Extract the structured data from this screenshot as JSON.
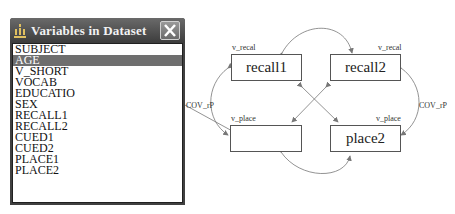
{
  "dialog": {
    "title": "Variables in Dataset",
    "icon": "variables-icon",
    "close_icon": "close-icon",
    "items": [
      {
        "label": "SUBJECT",
        "selected": false
      },
      {
        "label": "AGE",
        "selected": true
      },
      {
        "label": "V_SHORT",
        "selected": false
      },
      {
        "label": "VOCAB",
        "selected": false
      },
      {
        "label": "EDUCATIO",
        "selected": false
      },
      {
        "label": "SEX",
        "selected": false
      },
      {
        "label": "RECALL1",
        "selected": false
      },
      {
        "label": "RECALL2",
        "selected": false
      },
      {
        "label": "CUED1",
        "selected": false
      },
      {
        "label": "CUED2",
        "selected": false
      },
      {
        "label": "PLACE1",
        "selected": false
      },
      {
        "label": "PLACE2",
        "selected": false
      }
    ]
  },
  "diagram": {
    "nodes": {
      "recall1": {
        "label": "recall1",
        "variance": "v_recal"
      },
      "recall2": {
        "label": "recall2",
        "variance": "v_recal"
      },
      "place1": {
        "label": "",
        "variance": "v_place"
      },
      "place2": {
        "label": "place2",
        "variance": "v_place"
      }
    },
    "covariance_left": "COV_rP",
    "covariance_right": "COV_rP",
    "colors": {
      "line": "#777777",
      "box_border": "#555555"
    }
  }
}
